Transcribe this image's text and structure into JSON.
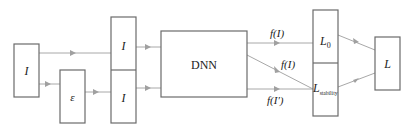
{
  "diagram": {
    "nodes": {
      "input": {
        "label": "I"
      },
      "noise": {
        "label": "ε"
      },
      "stack_top": {
        "label": "I"
      },
      "stack_bottom": {
        "label": "I"
      },
      "dnn": {
        "label": "DNN"
      },
      "loss0": {
        "label": "L",
        "sub": "0"
      },
      "loss_stab": {
        "label": "L",
        "sub": "stability"
      },
      "loss_total": {
        "label": "L"
      }
    },
    "edges": {
      "top": {
        "label": "f(I)"
      },
      "mid": {
        "label": "f(I)"
      },
      "bottom": {
        "label": "f(I′)"
      }
    },
    "colors": {
      "box_stroke": "#6b6b6b",
      "line": "#a8a8a8"
    }
  }
}
